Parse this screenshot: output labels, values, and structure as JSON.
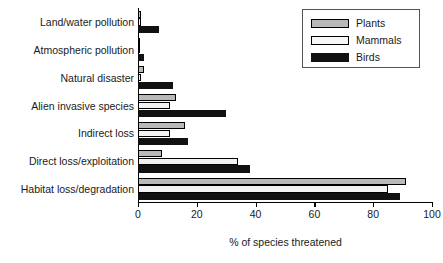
{
  "chart_data": {
    "type": "bar",
    "orientation": "horizontal",
    "title": "",
    "xlabel": "% of species threatened",
    "ylabel": "",
    "xlim": [
      0,
      100
    ],
    "xticks": [
      0,
      20,
      40,
      60,
      80,
      100
    ],
    "grid": false,
    "legend_position": "top-right",
    "categories": [
      "Land/water pollution",
      "Atmospheric pollution",
      "Natural disaster",
      "Alien invasive species",
      "Indirect loss",
      "Direct loss/exploitation",
      "Habitat loss/degradation"
    ],
    "series": [
      {
        "name": "Plants",
        "color": "#b9b9b9",
        "values": [
          1,
          0.5,
          2,
          13,
          16,
          8,
          91
        ]
      },
      {
        "name": "Mammals",
        "color": "#f2f2f2",
        "values": [
          1,
          0.5,
          1,
          11,
          11,
          34,
          85
        ]
      },
      {
        "name": "Birds",
        "color": "#111111",
        "values": [
          7,
          2,
          12,
          30,
          17,
          38,
          89
        ]
      }
    ]
  },
  "legend": {
    "items": [
      {
        "label": "Plants",
        "swatch": "plants"
      },
      {
        "label": "Mammals",
        "swatch": "mammals"
      },
      {
        "label": "Birds",
        "swatch": "birds"
      }
    ]
  }
}
